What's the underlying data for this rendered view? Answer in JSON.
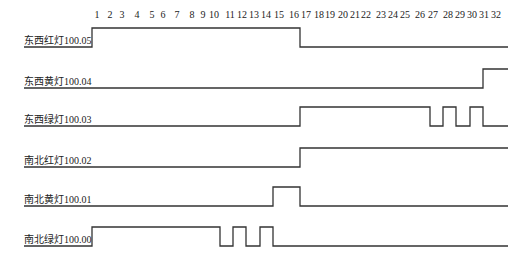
{
  "diagram": {
    "type": "timing",
    "time_axis": {
      "ticks": [
        "1",
        "2",
        "3",
        "4",
        "5",
        "6",
        "7",
        "8",
        "9",
        "10",
        "11",
        "12",
        "13",
        "14",
        "15",
        "16",
        "17",
        "18",
        "19",
        "20",
        "21",
        "22",
        "23",
        "24",
        "25",
        "26",
        "27",
        "28",
        "29",
        "30",
        "31",
        "32"
      ],
      "tick_x": [
        97,
        110,
        122,
        137,
        152,
        163,
        177,
        192,
        203,
        214,
        230,
        242,
        254,
        266,
        279,
        294,
        306,
        319,
        330,
        343,
        355,
        366,
        381,
        393,
        405,
        420,
        433,
        448,
        460,
        472,
        484,
        496
      ]
    },
    "signals": [
      {
        "label": "东西红灯100.05",
        "low_y": 47,
        "high_y": 28,
        "path": [
          [
            92,
            "H"
          ],
          [
            300,
            "L"
          ],
          [
            508,
            "L"
          ]
        ]
      },
      {
        "label": "东西黄灯100.04",
        "low_y": 88,
        "high_y": 69,
        "path": [
          [
            24,
            "L"
          ],
          [
            483,
            "H"
          ],
          [
            508,
            "H"
          ]
        ]
      },
      {
        "label": "东西绿灯100.03",
        "low_y": 126,
        "high_y": 107,
        "path": [
          [
            24,
            "L"
          ],
          [
            300,
            "H"
          ],
          [
            430,
            "L"
          ],
          [
            443,
            "H"
          ],
          [
            456,
            "L"
          ],
          [
            470,
            "H"
          ],
          [
            483,
            "L"
          ],
          [
            508,
            "L"
          ]
        ]
      },
      {
        "label": "南北红灯100.02",
        "low_y": 167,
        "high_y": 148,
        "path": [
          [
            24,
            "L"
          ],
          [
            300,
            "H"
          ],
          [
            508,
            "H"
          ]
        ]
      },
      {
        "label": "南北黄灯100.01",
        "low_y": 206,
        "high_y": 187,
        "path": [
          [
            24,
            "L"
          ],
          [
            273,
            "H"
          ],
          [
            300,
            "L"
          ],
          [
            508,
            "L"
          ]
        ]
      },
      {
        "label": "南北绿灯100.00",
        "low_y": 246,
        "high_y": 227,
        "path": [
          [
            24,
            "L"
          ],
          [
            92,
            "H"
          ],
          [
            220,
            "L"
          ],
          [
            233,
            "H"
          ],
          [
            246,
            "L"
          ],
          [
            260,
            "H"
          ],
          [
            273,
            "L"
          ],
          [
            508,
            "L"
          ]
        ]
      }
    ]
  }
}
